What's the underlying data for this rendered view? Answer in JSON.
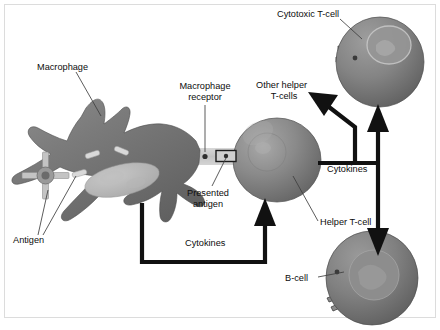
{
  "figure": {
    "background_color": "#ffffff",
    "frame_color": "#d8d8d8"
  },
  "palette": {
    "cell_dark": "#6f6f6f",
    "cell_mid": "#838383",
    "cell_light": "#9d9d9d",
    "cell_highlight": "#b4b4b4",
    "nucleus": "#8f8f8f",
    "nucleus_light": "#a8a8a8",
    "macrophage_nucleus": "#b9b9b9",
    "antigen_rod": "#d6d6d6",
    "antigen_cross": "#bfbfbf",
    "receptor_band": "#c9c9c9",
    "arrow_black": "#111111",
    "leader_line": "#3a3a3a",
    "text": "#0d0d0d"
  },
  "labels": {
    "macrophage": "Macrophage",
    "macrophage_receptor_line1": "Macrophage",
    "macrophage_receptor_line2": "receptor",
    "presented_antigen_line1": "Presented",
    "presented_antigen_line2": "antigen",
    "antigen": "Antigen",
    "cytokines_bottom": "Cytokines",
    "cytokines_right": "Cytokines",
    "other_helper_line1": "Other helper",
    "other_helper_line2": "T-cells",
    "helper_tcell": "Helper T-cell",
    "cytotoxic_tcell": "Cytotoxic T-cell",
    "bcell": "B-cell"
  },
  "cells": {
    "macrophage": {
      "name": "Macrophage",
      "cx": 118,
      "cy": 168
    },
    "helper_tcell": {
      "name": "Helper T-cell",
      "cx": 277,
      "cy": 160,
      "rx": 44,
      "ry": 42
    },
    "cytotoxic_tcell": {
      "name": "Cytotoxic T-cell",
      "cx": 380,
      "cy": 62,
      "rx": 44,
      "ry": 45
    },
    "bcell": {
      "name": "B-cell",
      "cx": 372,
      "cy": 278,
      "rx": 46,
      "ry": 47
    }
  },
  "structures": {
    "antigen_rods": 3,
    "antigen_cross_arms": 4,
    "receptor_dot": "macrophage-receptor",
    "presented_antigen_box": "presented-antigen"
  },
  "flows": [
    {
      "name": "cytokines-feedback",
      "from": "Macrophage",
      "to": "Helper T-cell",
      "label": "Cytokines"
    },
    {
      "name": "cytokines-to-other-helper",
      "from": "Helper T-cell",
      "to": "Other helper T-cells",
      "label": "Cytokines"
    },
    {
      "name": "cytokines-to-cytotoxic",
      "from": "Helper T-cell",
      "to": "Cytotoxic T-cell",
      "label": "Cytokines"
    },
    {
      "name": "cytokines-to-bcell",
      "from": "Helper T-cell",
      "to": "B-cell",
      "label": "Cytokines"
    }
  ]
}
